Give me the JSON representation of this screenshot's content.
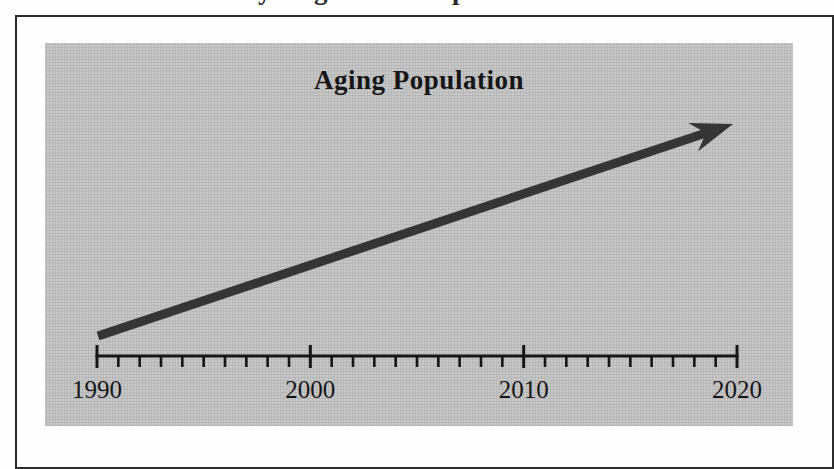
{
  "page": {
    "background": "#fefefe",
    "top_cropped_caption": {
      "note": "text line cut off at top edge of screenshot; only letter descenders visible",
      "fragments": [
        "y",
        "g",
        "p"
      ]
    }
  },
  "figure": {
    "title": "Aging Population",
    "panel_background": "#c9c9ca",
    "frame_border_color": "#2b2b2b",
    "ink_color": "#161616",
    "arrow_color": "#353535"
  },
  "chart_data": {
    "type": "line",
    "title": "Aging Population",
    "xlabel": "Year",
    "ylabel": "",
    "xlim": [
      1990,
      2020
    ],
    "x_major_ticks": [
      1990,
      2000,
      2010,
      2020
    ],
    "x_minor_tick_step_years": 1,
    "grid": false,
    "legend": false,
    "series": [
      {
        "name": "aging-population-trend",
        "style": "single thick straight arrow from lower-left to upper-right",
        "x": [
          1990,
          2020
        ],
        "y_relative": [
          0,
          1
        ]
      }
    ],
    "annotations": [
      "Upward arrow spanning 1990 to 2020 indicating a steadily increasing aging population; no numeric y-axis shown"
    ]
  }
}
